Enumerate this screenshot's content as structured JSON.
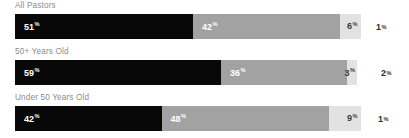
{
  "chart_data": {
    "type": "bar",
    "subtype": "stacked-horizontal-100",
    "title": "",
    "xlabel": "",
    "ylabel": "",
    "grid": false,
    "legend": "none",
    "xlim": [
      0,
      100
    ],
    "unit": "%",
    "categories": [
      "All Pastors",
      "50+ Years Old",
      "Under 50 Years Old"
    ],
    "series": [
      {
        "name": "segment-1",
        "color": "#080808",
        "values": [
          51,
          59,
          42
        ]
      },
      {
        "name": "segment-2",
        "color": "#a2a2a2",
        "values": [
          42,
          36,
          48
        ]
      },
      {
        "name": "segment-3",
        "color": "#e2e2e2",
        "values": [
          6,
          3,
          9
        ]
      },
      {
        "name": "segment-4",
        "color": "#ffffff",
        "values": [
          1,
          2,
          1
        ]
      }
    ],
    "rows": [
      {
        "label": "All Pastors",
        "segments": [
          {
            "value": "51",
            "pct": "%",
            "width": 51
          },
          {
            "value": "42",
            "pct": "%",
            "width": 42
          },
          {
            "value": "6",
            "pct": "%",
            "width": 6
          }
        ],
        "outside": {
          "value": "1",
          "pct": "%",
          "width": 1
        }
      },
      {
        "label": "50+ Years Old",
        "segments": [
          {
            "value": "59",
            "pct": "%",
            "width": 59
          },
          {
            "value": "36",
            "pct": "%",
            "width": 36
          },
          {
            "value": "3",
            "pct": "%",
            "width": 3
          }
        ],
        "outside": {
          "value": "2",
          "pct": "%",
          "width": 2
        }
      },
      {
        "label": "Under 50 Years Old",
        "segments": [
          {
            "value": "42",
            "pct": "%",
            "width": 42
          },
          {
            "value": "48",
            "pct": "%",
            "width": 48
          },
          {
            "value": "9",
            "pct": "%",
            "width": 9
          }
        ],
        "outside": {
          "value": "1",
          "pct": "%",
          "width": 1
        }
      }
    ]
  },
  "colors": {
    "background": "#ffffff",
    "dark": "#080808",
    "mid": "#a2a2a2",
    "light": "#e2e2e2",
    "label_text": "#8c8c8c",
    "outside_text": "#2e2e2e",
    "on_dark_text": "#ffffff"
  }
}
